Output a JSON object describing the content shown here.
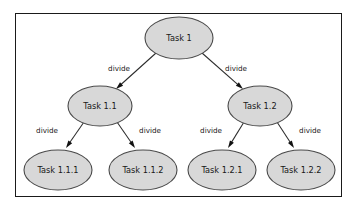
{
  "diagram": {
    "frame": {
      "border_color": "#1a1a1a",
      "background_color": "#ffffff"
    },
    "style": {
      "node_fill": "#d8d8d8",
      "node_stroke": "#4a4a4a",
      "edge_color": "#2b2b2b",
      "text_color": "#181818"
    },
    "nodes": [
      {
        "id": "task1",
        "label": "Task 1",
        "cx": 179,
        "cy": 38,
        "rx": 34,
        "ry": 21,
        "level": 0
      },
      {
        "id": "task1_1",
        "label": "Task 1.1",
        "cx": 100,
        "cy": 106,
        "rx": 32,
        "ry": 20,
        "level": 1
      },
      {
        "id": "task1_2",
        "label": "Task 1.2",
        "cx": 260,
        "cy": 106,
        "rx": 32,
        "ry": 20,
        "level": 1
      },
      {
        "id": "task1_1_1",
        "label": "Task 1.1.1",
        "cx": 58,
        "cy": 170,
        "rx": 34,
        "ry": 20,
        "level": 2
      },
      {
        "id": "task1_1_2",
        "label": "Task 1.1.2",
        "cx": 143,
        "cy": 170,
        "rx": 34,
        "ry": 20,
        "level": 2
      },
      {
        "id": "task1_2_1",
        "label": "Task 1.2.1",
        "cx": 222,
        "cy": 170,
        "rx": 34,
        "ry": 20,
        "level": 2
      },
      {
        "id": "task1_2_2",
        "label": "Task 1.2.2",
        "cx": 301,
        "cy": 170,
        "rx": 34,
        "ry": 20,
        "level": 2
      }
    ],
    "edges": [
      {
        "id": "e1",
        "from": "task1",
        "to": "task1_1",
        "label": "divide",
        "x1": 156,
        "y1": 53,
        "x2": 116,
        "y2": 89,
        "lx": 119,
        "ly": 69
      },
      {
        "id": "e2",
        "from": "task1",
        "to": "task1_2",
        "label": "divide",
        "x1": 202,
        "y1": 53,
        "x2": 243,
        "y2": 89,
        "lx": 236,
        "ly": 69
      },
      {
        "id": "e3",
        "from": "task1_1",
        "to": "task1_1_1",
        "label": "divide",
        "x1": 84,
        "y1": 122,
        "x2": 66,
        "y2": 148,
        "lx": 47,
        "ly": 131
      },
      {
        "id": "e4",
        "from": "task1_1",
        "to": "task1_1_2",
        "label": "divide",
        "x1": 117,
        "y1": 122,
        "x2": 135,
        "y2": 148,
        "lx": 150,
        "ly": 131
      },
      {
        "id": "e5",
        "from": "task1_2",
        "to": "task1_2_1",
        "label": "divide",
        "x1": 244,
        "y1": 122,
        "x2": 228,
        "y2": 148,
        "lx": 211,
        "ly": 131
      },
      {
        "id": "e6",
        "from": "task1_2",
        "to": "task1_2_2",
        "label": "divide",
        "x1": 277,
        "y1": 122,
        "x2": 294,
        "y2": 148,
        "lx": 310,
        "ly": 131
      }
    ]
  }
}
